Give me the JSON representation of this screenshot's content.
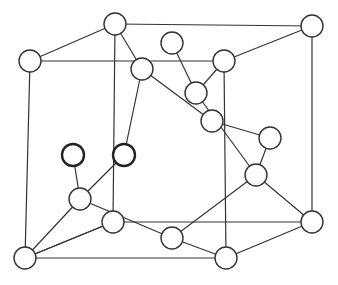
{
  "diagram": {
    "type": "crystal-lattice",
    "colors": {
      "line": "#333333",
      "atom_fill": "#ffffff",
      "background": "#ffffff"
    },
    "atom_radius": 11,
    "atoms": [
      {
        "id": "a1",
        "x": 30,
        "y": 61,
        "bold": false
      },
      {
        "id": "a2",
        "x": 115,
        "y": 24,
        "bold": false
      },
      {
        "id": "a3",
        "x": 312,
        "y": 26,
        "bold": false
      },
      {
        "id": "a4",
        "x": 224,
        "y": 61,
        "bold": false
      },
      {
        "id": "a5",
        "x": 172,
        "y": 43,
        "bold": false
      },
      {
        "id": "a6",
        "x": 142,
        "y": 69,
        "bold": false
      },
      {
        "id": "a7",
        "x": 196,
        "y": 93,
        "bold": false
      },
      {
        "id": "a8",
        "x": 212,
        "y": 121,
        "bold": false
      },
      {
        "id": "a9",
        "x": 270,
        "y": 138,
        "bold": false
      },
      {
        "id": "a10",
        "x": 256,
        "y": 175,
        "bold": false
      },
      {
        "id": "a11",
        "x": 73,
        "y": 155,
        "bold": true
      },
      {
        "id": "a12",
        "x": 124,
        "y": 155,
        "bold": true
      },
      {
        "id": "a13",
        "x": 80,
        "y": 199,
        "bold": false
      },
      {
        "id": "a14",
        "x": 113,
        "y": 222,
        "bold": false
      },
      {
        "id": "a15",
        "x": 312,
        "y": 222,
        "bold": false
      },
      {
        "id": "a16",
        "x": 172,
        "y": 238,
        "bold": false
      },
      {
        "id": "a17",
        "x": 25,
        "y": 258,
        "bold": false
      },
      {
        "id": "a18",
        "x": 226,
        "y": 258,
        "bold": false
      }
    ],
    "bonds": [
      [
        "a1",
        "a2"
      ],
      [
        "a2",
        "a3"
      ],
      [
        "a1",
        "a4"
      ],
      [
        "a3",
        "a4"
      ],
      [
        "a1",
        "a17"
      ],
      [
        "a2",
        "a14"
      ],
      [
        "a3",
        "a15"
      ],
      [
        "a4",
        "a18"
      ],
      [
        "a17",
        "a18"
      ],
      [
        "a14",
        "a15"
      ],
      [
        "a18",
        "a15"
      ],
      [
        "a17",
        "a14"
      ],
      [
        "a2",
        "a6"
      ],
      [
        "a6",
        "a12"
      ],
      [
        "a12",
        "a13"
      ],
      [
        "a5",
        "a7"
      ],
      [
        "a4",
        "a7"
      ],
      [
        "a7",
        "a10"
      ],
      [
        "a6",
        "a8"
      ],
      [
        "a8",
        "a9"
      ],
      [
        "a9",
        "a10"
      ],
      [
        "a11",
        "a13"
      ],
      [
        "a13",
        "a17"
      ],
      [
        "a13",
        "a16"
      ],
      [
        "a10",
        "a16"
      ],
      [
        "a10",
        "a15"
      ],
      [
        "a16",
        "a18"
      ],
      [
        "a14",
        "a17"
      ]
    ]
  }
}
